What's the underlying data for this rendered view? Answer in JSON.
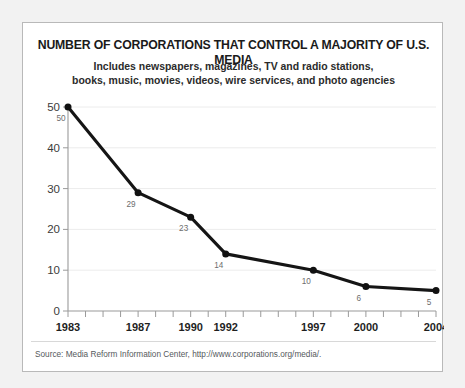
{
  "card": {
    "title": "NUMBER OF CORPORATIONS THAT CONTROL A MAJORITY OF U.S. MEDIA",
    "subtitle_line1": "Includes newspapers, magazines, TV and radio stations,",
    "subtitle_line2": "books, music, movies, videos, wire services, and photo agencies",
    "source": "Source: Media Reform Information Center, http://www.corporations.org/media/."
  },
  "chart_data": {
    "type": "line",
    "title": "NUMBER OF CORPORATIONS THAT CONTROL A MAJORITY OF U.S. MEDIA",
    "subtitle": "Includes newspapers, magazines, TV and radio stations, books, music, movies, videos, wire services, and photo agencies",
    "xlabel": "",
    "ylabel": "",
    "x": [
      1983,
      1987,
      1990,
      1992,
      1997,
      2000,
      2004
    ],
    "values": [
      50,
      29,
      23,
      14,
      10,
      6,
      5
    ],
    "point_labels": [
      "50",
      "29",
      "23",
      "14",
      "10",
      "6",
      "5"
    ],
    "xlim": [
      1983,
      2004
    ],
    "ylim": [
      0,
      50
    ],
    "yticks": [
      0,
      10,
      20,
      30,
      40,
      50
    ],
    "ytick_labels": [
      "0",
      "10",
      "20",
      "30",
      "40",
      "50"
    ],
    "xticks": [
      1983,
      1984,
      1985,
      1986,
      1987,
      1988,
      1989,
      1990,
      1991,
      1992,
      1993,
      1994,
      1995,
      1996,
      1997,
      1998,
      1999,
      2000,
      2001,
      2002,
      2003,
      2004
    ],
    "xtick_labels_shown": [
      "1983",
      "1987",
      "1990",
      "1992",
      "1997",
      "2000",
      "2004"
    ],
    "grid": "horizontal",
    "legend": "none",
    "line_color": "#151515",
    "marker_color": "#111111",
    "grid_color": "#ececec",
    "axis_color": "#9a9a9a"
  }
}
